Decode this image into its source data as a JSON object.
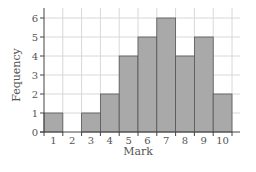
{
  "chart_data": {
    "type": "bar",
    "title": "",
    "xlabel": "Mark",
    "ylabel": "Fequency",
    "categories": [
      "1",
      "2",
      "3",
      "4",
      "5",
      "6",
      "7",
      "8",
      "9",
      "10"
    ],
    "values": [
      1,
      0,
      1,
      2,
      4,
      5,
      6,
      4,
      5,
      2
    ],
    "ylim": [
      0,
      6
    ],
    "yticks": [
      0,
      1,
      2,
      3,
      4,
      5,
      6
    ],
    "grid": true,
    "bar_color": "#a9a9a9",
    "grid_color": "#d8d8d8"
  }
}
